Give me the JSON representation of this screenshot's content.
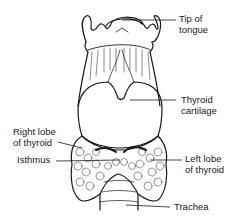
{
  "diagram": {
    "labels": {
      "tip_of_tongue": [
        "Tip of",
        "tongue"
      ],
      "thyroid_cartilage": [
        "Thyroid",
        "cartilage"
      ],
      "right_lobe": [
        "Right lobe",
        "of thyroid"
      ],
      "isthmus": [
        "Isthmus"
      ],
      "left_lobe": [
        "Left lobe",
        "of thyroid"
      ],
      "trachea": [
        "Trachea"
      ]
    },
    "colors": {
      "ink": "#1a1a1a",
      "background": "#ffffff"
    }
  }
}
